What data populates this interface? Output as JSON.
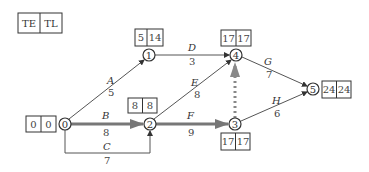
{
  "legend": {
    "left": "TE",
    "right": "TL"
  },
  "nodes": [
    {
      "id": "0",
      "x": 65,
      "y": 124,
      "te": "0",
      "tl": "0",
      "box": {
        "x": 26,
        "y": 116
      },
      "label": "0"
    },
    {
      "id": "1",
      "x": 149,
      "y": 55,
      "te": "5",
      "tl": "14",
      "box": {
        "x": 135,
        "y": 29
      },
      "label": "1"
    },
    {
      "id": "2",
      "x": 150,
      "y": 124,
      "te": "8",
      "tl": "8",
      "box": {
        "x": 128,
        "y": 98
      },
      "label": "2"
    },
    {
      "id": "3",
      "x": 235,
      "y": 124,
      "te": "17",
      "tl": "17",
      "box": {
        "x": 221,
        "y": 133
      },
      "label": "3"
    },
    {
      "id": "4",
      "x": 236,
      "y": 55,
      "te": "17",
      "tl": "17",
      "box": {
        "x": 221,
        "y": 30
      },
      "label": "4"
    },
    {
      "id": "5",
      "x": 313,
      "y": 89,
      "te": "24",
      "tl": "24",
      "box": {
        "x": 322,
        "y": 81
      },
      "label": "5"
    }
  ],
  "activities": [
    {
      "name": "A",
      "duration": "5",
      "from": "0",
      "to": "1",
      "critical": false
    },
    {
      "name": "B",
      "duration": "8",
      "from": "0",
      "to": "2",
      "critical": true
    },
    {
      "name": "C",
      "duration": "7",
      "from": "0",
      "to": "2",
      "critical": false
    },
    {
      "name": "D",
      "duration": "3",
      "from": "1",
      "to": "4",
      "critical": false
    },
    {
      "name": "E",
      "duration": "8",
      "from": "2",
      "to": "4",
      "critical": false
    },
    {
      "name": "F",
      "duration": "9",
      "from": "2",
      "to": "3",
      "critical": true
    },
    {
      "name": "G",
      "duration": "7",
      "from": "4",
      "to": "5",
      "critical": false
    },
    {
      "name": "H",
      "duration": "6",
      "from": "3",
      "to": "5",
      "critical": false
    },
    {
      "name": "",
      "duration": "",
      "from": "3",
      "to": "4",
      "critical": true,
      "dummy": true
    }
  ]
}
